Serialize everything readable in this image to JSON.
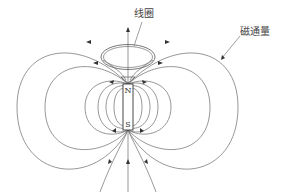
{
  "diagram": {
    "type": "magnetic-field-lines",
    "labels": {
      "coil": "线圈",
      "flux": "磁通量"
    },
    "magnet": {
      "north_label": "N",
      "south_label": "S"
    },
    "colors": {
      "line": "#6a6a6a",
      "magnet_border": "#333333",
      "text": "#444444"
    }
  }
}
